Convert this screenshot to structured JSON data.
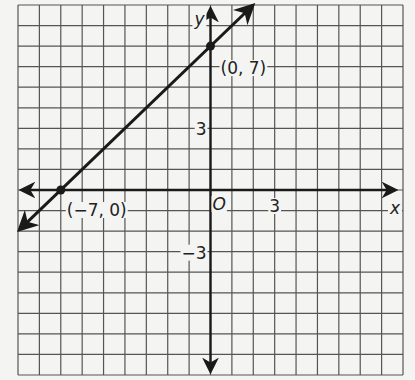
{
  "chart_data": {
    "type": "line",
    "title": "",
    "xlabel": "x",
    "ylabel": "y",
    "origin_label": "O",
    "xlim": [
      -9,
      9
    ],
    "ylim": [
      -9,
      9
    ],
    "grid": true,
    "x_ticks": [
      {
        "value": 3,
        "label": "3"
      }
    ],
    "y_ticks": [
      {
        "value": 3,
        "label": "3"
      },
      {
        "value": -3,
        "label": "−3"
      }
    ],
    "series": [
      {
        "name": "line",
        "equation": "y = x + 7",
        "x": [
          -9,
          2
        ],
        "y": [
          -2,
          9
        ]
      }
    ],
    "points": [
      {
        "x": 0,
        "y": 7,
        "label": "(0, 7)"
      },
      {
        "x": -7,
        "y": 0,
        "label": "(−7, 0)"
      }
    ]
  },
  "colors": {
    "grid": "#555555",
    "axis": "#1a1a1a",
    "line": "#1a1a1a",
    "background": "#f4f4f2"
  }
}
